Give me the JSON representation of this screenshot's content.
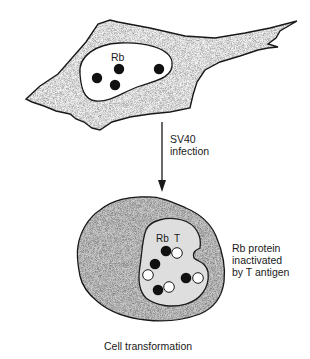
{
  "diagram": {
    "type": "biology-illustration",
    "top_cell": {
      "nucleus_label": "Rb",
      "rb_dot_count": 4,
      "state": "normal"
    },
    "transition": {
      "line1": "SV40",
      "line2": "infection"
    },
    "bottom_cell": {
      "label_rb": "Rb",
      "label_t": "T",
      "complex_count": 4,
      "state": "transformed"
    },
    "annotation": {
      "line1": "Rb protein",
      "line2": "inactivated",
      "line3": "by T antigen"
    },
    "caption": "Cell transformation",
    "colors": {
      "cytoplasm_top": "#f2f2f2",
      "cytoplasm_bottom": "#c9c9c9",
      "nucleus_bottom": "#dedede",
      "rb_protein": "#111111",
      "t_antigen": "#ffffff",
      "outline": "#1a1a1a"
    }
  }
}
